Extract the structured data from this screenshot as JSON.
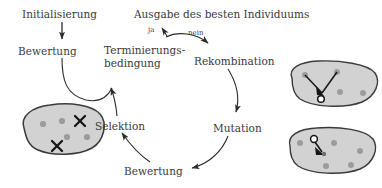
{
  "diagram": {
    "title_text": "Ausgabe des besten Individuums",
    "type": "evolutionary-algorithm-cycle",
    "language": "de",
    "colors": {
      "text": "#3a3a3a",
      "stroke": "#2b2b2b",
      "blob_fill": "#d2d2d2",
      "blob_stroke": "#3a3a3a",
      "dot_fill": "#9c9c9c",
      "mark_fill": "#1a1a1a"
    },
    "nodes": [
      {
        "id": "initialisierung",
        "label": "Initialisierung",
        "x": 22,
        "y": 8
      },
      {
        "id": "bewertung_top",
        "label": "Bewertung",
        "x": 18,
        "y": 45
      },
      {
        "id": "terminierungsbedingung",
        "label": "Terminierungs-\nbedingung",
        "line1": "Terminierungs-",
        "line2": "bedingung",
        "x": 104,
        "y": 44
      },
      {
        "id": "ausgabe",
        "label": "Ausgabe des besten Individuums",
        "x": 134,
        "y": 8
      },
      {
        "id": "rekombination",
        "label": "Rekombination",
        "x": 194,
        "y": 55
      },
      {
        "id": "mutation",
        "label": "Mutation",
        "x": 213,
        "y": 122
      },
      {
        "id": "bewertung_bottom",
        "label": "Bewertung",
        "x": 124,
        "y": 165
      },
      {
        "id": "selektion",
        "label": "Selektion",
        "x": 95,
        "y": 120
      }
    ],
    "edge_labels": [
      {
        "id": "ja",
        "label": "ja",
        "x": 148,
        "y": 26
      },
      {
        "id": "nein",
        "label": "nein",
        "x": 188,
        "y": 29
      }
    ],
    "edges": [
      {
        "from": "initialisierung",
        "to": "bewertung_top",
        "label": ""
      },
      {
        "from": "bewertung_top",
        "to": "terminierungsbedingung",
        "label": ""
      },
      {
        "from": "terminierungsbedingung",
        "to": "ausgabe",
        "label": "ja"
      },
      {
        "from": "terminierungsbedingung",
        "to": "rekombination",
        "label": "nein"
      },
      {
        "from": "rekombination",
        "to": "mutation",
        "label": ""
      },
      {
        "from": "mutation",
        "to": "bewertung_bottom",
        "label": ""
      },
      {
        "from": "bewertung_bottom",
        "to": "selektion",
        "label": ""
      },
      {
        "from": "selektion",
        "to": "terminierungsbedingung",
        "label": ""
      }
    ],
    "populations": [
      {
        "id": "selection-population",
        "attached_to": "selektion",
        "description": "population blob with two individuals marked by X for elimination",
        "dots": 4,
        "marks": 2
      },
      {
        "id": "recombination-population",
        "attached_to": "rekombination",
        "description": "population blob with two parents linked to one new offspring circle",
        "dots": 4,
        "offspring": 1
      },
      {
        "id": "mutation-population",
        "attached_to": "mutation",
        "description": "population blob with one individual mutated into a new position",
        "dots": 5,
        "offspring": 1
      }
    ]
  }
}
